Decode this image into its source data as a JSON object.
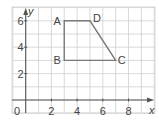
{
  "chart_data": {
    "type": "diagram",
    "title": "",
    "xlabel": "x",
    "ylabel": "y",
    "origin_label": "0",
    "x_ticks": [
      "2",
      "4",
      "6",
      "8"
    ],
    "y_ticks": [
      "2",
      "4",
      "6"
    ],
    "xlim": [
      -1,
      10
    ],
    "ylim": [
      -1,
      7
    ],
    "grid": true,
    "shape": "trapezium",
    "points": [
      {
        "label": "A",
        "x": 3,
        "y": 6
      },
      {
        "label": "B",
        "x": 3,
        "y": 3
      },
      {
        "label": "C",
        "x": 7,
        "y": 3
      },
      {
        "label": "D",
        "x": 5,
        "y": 6
      }
    ],
    "polygon_order": [
      "A",
      "D",
      "C",
      "B"
    ]
  },
  "colors": {
    "grid": "#cfcfcf",
    "axis": "#555555",
    "shape": "#7a7a7a",
    "text": "#444444"
  }
}
